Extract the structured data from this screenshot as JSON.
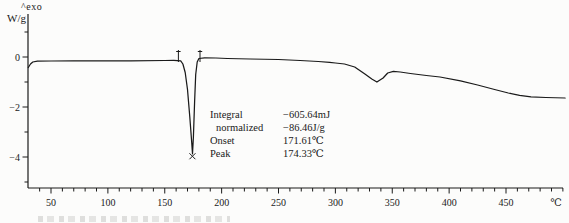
{
  "figure": {
    "exo_label": "^exo",
    "y_unit_label": "W/g",
    "x_unit_label": "℃"
  },
  "annotation": {
    "rows": [
      {
        "label": "Integral",
        "value": "−605.64mJ"
      },
      {
        "label": "normalized",
        "value": "−86.46J/g"
      },
      {
        "label": "Onset",
        "value": "171.61℃"
      },
      {
        "label": "Peak",
        "value": "174.33℃"
      }
    ]
  },
  "chart_data": {
    "type": "line",
    "xlabel": "℃",
    "ylabel": "W/g",
    "xlim": [
      30,
      505
    ],
    "ylim": [
      -5.2,
      1.3
    ],
    "grid": false,
    "x_major_ticks": [
      50,
      100,
      150,
      200,
      250,
      300,
      350,
      400,
      450
    ],
    "x_minor_step": 10,
    "y_major_ticks": [
      0,
      -2,
      -4
    ],
    "y_minor_ticks": [
      1,
      -1,
      -3,
      -5
    ],
    "integration_limits_c": [
      162,
      181
    ],
    "peak": {
      "integral_mJ": -605.64,
      "normalized_J_per_g": -86.46,
      "onset_c": 171.61,
      "peak_c": 174.33,
      "peak_min_W_per_g": -3.87
    },
    "series": [
      {
        "name": "heat-flow",
        "points": [
          [
            30,
            -0.42
          ],
          [
            32,
            -0.28
          ],
          [
            34,
            -0.2
          ],
          [
            38,
            -0.165
          ],
          [
            50,
            -0.16
          ],
          [
            70,
            -0.155
          ],
          [
            90,
            -0.15
          ],
          [
            120,
            -0.15
          ],
          [
            150,
            -0.14
          ],
          [
            158,
            -0.13
          ],
          [
            164,
            -0.15
          ],
          [
            166,
            -0.28
          ],
          [
            168,
            -0.62
          ],
          [
            170,
            -1.3
          ],
          [
            172,
            -2.4
          ],
          [
            173.5,
            -3.3
          ],
          [
            174.4,
            -3.87
          ],
          [
            175.2,
            -3.2
          ],
          [
            176.2,
            -1.8
          ],
          [
            177.2,
            -0.7
          ],
          [
            178.5,
            -0.2
          ],
          [
            180,
            -0.06
          ],
          [
            185,
            -0.03
          ],
          [
            195,
            -0.04
          ],
          [
            205,
            -0.06
          ],
          [
            225,
            -0.08
          ],
          [
            250,
            -0.1
          ],
          [
            269,
            -0.14
          ],
          [
            285,
            -0.18
          ],
          [
            295,
            -0.21
          ],
          [
            300,
            -0.24
          ],
          [
            308,
            -0.28
          ],
          [
            317,
            -0.4
          ],
          [
            326,
            -0.68
          ],
          [
            332,
            -0.88
          ],
          [
            336.5,
            -1.0
          ],
          [
            342,
            -0.84
          ],
          [
            346,
            -0.64
          ],
          [
            351,
            -0.57
          ],
          [
            357,
            -0.6
          ],
          [
            366,
            -0.66
          ],
          [
            380,
            -0.74
          ],
          [
            392,
            -0.8
          ],
          [
            410,
            -0.95
          ],
          [
            425,
            -1.12
          ],
          [
            440,
            -1.3
          ],
          [
            452,
            -1.44
          ],
          [
            462,
            -1.53
          ],
          [
            472,
            -1.59
          ],
          [
            485,
            -1.62
          ],
          [
            502,
            -1.64
          ]
        ]
      }
    ]
  }
}
